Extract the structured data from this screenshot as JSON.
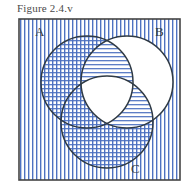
{
  "figure": {
    "caption": "Figure 2.4.v",
    "type": "venn-diagram-3-set",
    "universe_label": "",
    "background_color": "#ffffff",
    "box": {
      "border_color": "#444444",
      "x": 19,
      "y": 19,
      "width": 161,
      "height": 161
    },
    "hatch_color": "#4a6fc0",
    "circle_stroke_color": "#2f3a44",
    "labels": {
      "a": "A",
      "b": "B",
      "c": "C"
    },
    "circles": [
      {
        "id": "A",
        "label": "A",
        "cx": 87,
        "cy": 82,
        "r": 46,
        "label_x": 35,
        "label_y": 36
      },
      {
        "id": "B",
        "label": "B",
        "cx": 127,
        "cy": 82,
        "r": 46,
        "label_x": 155,
        "label_y": 36
      },
      {
        "id": "C",
        "label": "C",
        "cx": 107,
        "cy": 122,
        "r": 46,
        "label_x": 131,
        "label_y": 173
      }
    ],
    "regions": [
      {
        "name": "outside-all-circles",
        "shading": "vertical-lines"
      },
      {
        "name": "A-only",
        "shading": "crosshatch"
      },
      {
        "name": "B-only",
        "shading": "none"
      },
      {
        "name": "C-only",
        "shading": "crosshatch"
      },
      {
        "name": "A-intersect-B-not-C",
        "shading": "horizontal-lines"
      },
      {
        "name": "A-intersect-C-not-B",
        "shading": "crosshatch"
      },
      {
        "name": "B-intersect-C-not-A",
        "shading": "horizontal-lines"
      },
      {
        "name": "A-intersect-B-intersect-C",
        "shading": "none"
      }
    ]
  }
}
